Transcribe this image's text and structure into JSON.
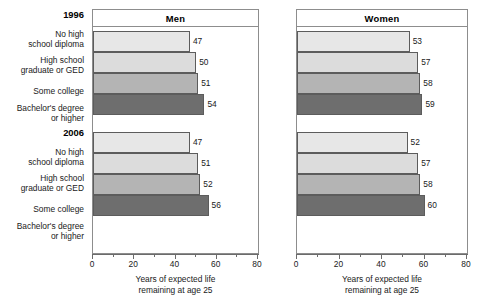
{
  "chart_data": {
    "type": "bar",
    "orientation": "horizontal",
    "title": "",
    "xlabel": "Years of expected life remaining at age 25",
    "ylabel": "",
    "xlim": [
      0,
      80
    ],
    "xticks": [
      0,
      20,
      40,
      60,
      80
    ],
    "xtick_labels": [
      "0",
      "20",
      "40",
      "60",
      "80"
    ],
    "minor_tick_step": 10,
    "grid": false,
    "legend": "none",
    "categories": [
      "No high school diploma",
      "High school graduate or GED",
      "Some college",
      "Bachelor's degree or higher"
    ],
    "group_labels": [
      "1996",
      "2006"
    ],
    "panels": [
      {
        "name": "Men",
        "groups": [
          {
            "label": "1996",
            "values": [
              47,
              50,
              51,
              54
            ]
          },
          {
            "label": "2006",
            "values": [
              47,
              51,
              52,
              56
            ]
          }
        ]
      },
      {
        "name": "Women",
        "groups": [
          {
            "label": "1996",
            "values": [
              53,
              57,
              58,
              59
            ]
          },
          {
            "label": "2006",
            "values": [
              52,
              57,
              58,
              60
            ]
          }
        ]
      }
    ],
    "bar_colors": [
      "#e7e7e7",
      "#dcdcdc",
      "#b4b4b4",
      "#6e6e6e"
    ]
  },
  "axis": {
    "title_line1": "Years of expected life",
    "title_line2": "remaining at age 25",
    "ticks": [
      "0",
      "20",
      "40",
      "60",
      "80"
    ]
  },
  "categories": {
    "c0_line1": "No high",
    "c0_line2": "school diploma",
    "c1_line1": "High school",
    "c1_line2": "graduate or GED",
    "c2_line1": "Some college",
    "c3_line1": "Bachelor's degree",
    "c3_line2": "or higher"
  },
  "years": {
    "y1996": "1996",
    "y2006": "2006"
  },
  "panels": {
    "men": "Men",
    "women": "Women"
  },
  "values": {
    "men_1996": [
      "47",
      "50",
      "51",
      "54"
    ],
    "men_2006": [
      "47",
      "51",
      "52",
      "56"
    ],
    "women_1996": [
      "53",
      "57",
      "58",
      "59"
    ],
    "women_2006": [
      "52",
      "57",
      "58",
      "60"
    ]
  }
}
